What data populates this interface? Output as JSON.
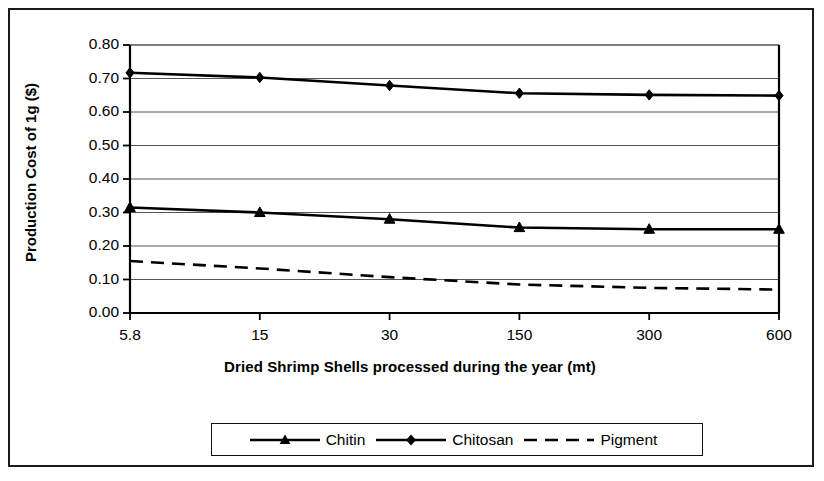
{
  "chart_data": {
    "type": "line",
    "title": "",
    "xlabel": "Dried Shrimp Shells processed during the year (mt)",
    "ylabel": "Production Cost of 1g ($)",
    "categories": [
      "5.8",
      "15",
      "30",
      "150",
      "300",
      "600"
    ],
    "xtick_labels": [
      "5.8",
      "15",
      "30",
      "150",
      "300",
      "600"
    ],
    "ytick_labels": [
      "0.00",
      "0.10",
      "0.20",
      "0.30",
      "0.40",
      "0.50",
      "0.60",
      "0.70",
      "0.80"
    ],
    "ylim": [
      0.0,
      0.8
    ],
    "ytick_step": 0.1,
    "grid": true,
    "grid_axis": "y",
    "legend_position": "bottom",
    "series": [
      {
        "name": "Chitin",
        "marker": "triangle",
        "linestyle": "solid",
        "color": "#000000",
        "values": [
          0.315,
          0.3,
          0.28,
          0.255,
          0.25,
          0.25
        ]
      },
      {
        "name": "Chitosan",
        "marker": "diamond",
        "linestyle": "solid",
        "color": "#000000",
        "values": [
          0.717,
          0.703,
          0.679,
          0.656,
          0.651,
          0.649
        ]
      },
      {
        "name": "Pigment",
        "marker": "none",
        "linestyle": "dashed",
        "color": "#000000",
        "values": [
          0.155,
          0.133,
          0.107,
          0.085,
          0.075,
          0.07
        ]
      }
    ]
  },
  "legend": {
    "items": [
      {
        "label": "Chitin"
      },
      {
        "label": "Chitosan"
      },
      {
        "label": "Pigment"
      }
    ]
  },
  "colors": {
    "line": "#000000",
    "grid": "#555555",
    "frame": "#1a1a1a",
    "background": "#ffffff"
  }
}
